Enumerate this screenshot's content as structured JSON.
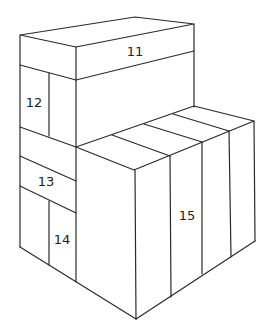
{
  "diagram": {
    "line_color": "#2a2a2a",
    "background": "#ffffff",
    "labels": [
      {
        "id": "box-11",
        "text": "11",
        "x": 135,
        "y": 52
      },
      {
        "id": "box-12",
        "text": "12",
        "x": 34,
        "y": 103
      },
      {
        "id": "box-13",
        "text": "13",
        "x": 46,
        "y": 182
      },
      {
        "id": "box-14",
        "text": "14",
        "x": 62,
        "y": 240
      },
      {
        "id": "box-15",
        "text": "15",
        "x": 187,
        "y": 216
      }
    ]
  }
}
